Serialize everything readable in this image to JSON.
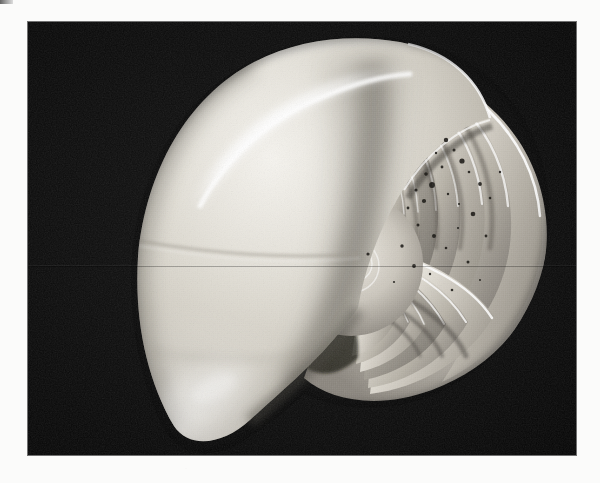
{
  "page": {
    "background_color": "#fbfbfa",
    "width": 600,
    "height": 483,
    "corner_smudge_label": ""
  },
  "photo": {
    "title": "Nautilus shell cut in half, sagittal cross-section",
    "subject": "nautilus-shell",
    "medium": "black-and-white photograph",
    "background_color": "#090909",
    "frame": {
      "x": 28,
      "y": 22,
      "width": 548,
      "height": 433
    },
    "alt_text": "A chambered nautilus shell sliced in half, showing the logarithmic spiral of internal chambers against a black background.",
    "caption": ""
  },
  "shell": {
    "name": "chambered-nautilus",
    "shell_color_light": "#f2f0ea",
    "shell_color_mid": "#cfcbc2",
    "shell_color_shadow": "#8e8a82",
    "highlight_color": "#ffffff",
    "spiral_center": {
      "x": 337,
      "y": 233
    },
    "body_whorl_label": "body chamber",
    "septa_label": "septa",
    "siphuncle_label": "siphuncle",
    "chamber_count": 22,
    "speckles": [
      {
        "x": 418,
        "y": 118,
        "r": 2.2
      },
      {
        "x": 426,
        "y": 128,
        "r": 1.5
      },
      {
        "x": 408,
        "y": 131,
        "r": 1.2
      },
      {
        "x": 434,
        "y": 139,
        "r": 2.6
      },
      {
        "x": 414,
        "y": 145,
        "r": 1.4
      },
      {
        "x": 398,
        "y": 152,
        "r": 1.8
      },
      {
        "x": 441,
        "y": 150,
        "r": 1.3
      },
      {
        "x": 404,
        "y": 163,
        "r": 2.9
      },
      {
        "x": 388,
        "y": 168,
        "r": 1.6
      },
      {
        "x": 420,
        "y": 172,
        "r": 1.2
      },
      {
        "x": 396,
        "y": 179,
        "r": 2.1
      },
      {
        "x": 431,
        "y": 182,
        "r": 1.1
      },
      {
        "x": 380,
        "y": 186,
        "r": 1.4
      },
      {
        "x": 452,
        "y": 162,
        "r": 1.9
      },
      {
        "x": 462,
        "y": 176,
        "r": 1.3
      },
      {
        "x": 445,
        "y": 192,
        "r": 2.3
      },
      {
        "x": 472,
        "y": 150,
        "r": 1.2
      },
      {
        "x": 390,
        "y": 203,
        "r": 1.5
      },
      {
        "x": 406,
        "y": 214,
        "r": 2.0
      },
      {
        "x": 418,
        "y": 226,
        "r": 1.3
      },
      {
        "x": 374,
        "y": 224,
        "r": 1.7
      },
      {
        "x": 430,
        "y": 206,
        "r": 1.1
      },
      {
        "x": 458,
        "y": 214,
        "r": 1.4
      },
      {
        "x": 386,
        "y": 244,
        "r": 1.9
      },
      {
        "x": 402,
        "y": 252,
        "r": 1.2
      },
      {
        "x": 440,
        "y": 240,
        "r": 1.5
      },
      {
        "x": 366,
        "y": 260,
        "r": 1.1
      },
      {
        "x": 424,
        "y": 268,
        "r": 1.3
      },
      {
        "x": 452,
        "y": 258,
        "r": 1.0
      },
      {
        "x": 340,
        "y": 232,
        "r": 1.6
      }
    ]
  },
  "artifacts": {
    "scan_seam_label": "scan-seam",
    "grain_label": "film-grain"
  }
}
